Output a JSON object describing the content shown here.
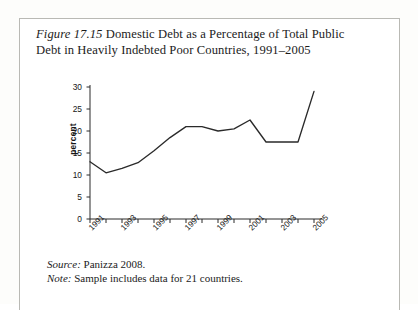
{
  "caption": {
    "figure_label": "Figure 17.15",
    "text": " Domestic Debt as a Percentage of Total Public Debt in Heavily Indebted Poor Countries, 1991–2005"
  },
  "notes": {
    "source_label": "Source:",
    "source_text": " Panizza 2008.",
    "note_label": "Note:",
    "note_text": " Sample includes data for 21 countries."
  },
  "chart_data": {
    "type": "line",
    "title": "Domestic Debt as a Percentage of Total Public Debt in Heavily Indebted Poor Countries, 1991–2005",
    "xlabel": "",
    "ylabel": "percent",
    "x": [
      1991,
      1992,
      1993,
      1994,
      1995,
      1996,
      1997,
      1998,
      1999,
      2000,
      2001,
      2002,
      2003,
      2004,
      2005
    ],
    "values": [
      13.0,
      10.5,
      11.5,
      12.8,
      15.5,
      18.5,
      21.0,
      21.0,
      20.0,
      20.5,
      22.5,
      17.5,
      17.5,
      17.5,
      29.0
    ],
    "ylim": [
      0,
      30
    ],
    "yticks": [
      0,
      5,
      10,
      15,
      20,
      25,
      30
    ],
    "xlim": [
      1991,
      2005
    ],
    "xtick_labels": [
      "1991",
      "1993",
      "1995",
      "1997",
      "1999",
      "2001",
      "2003",
      "2005"
    ],
    "xtick_years": [
      1991,
      1993,
      1995,
      1997,
      1999,
      2001,
      2003,
      2005
    ],
    "grid": false,
    "legend": "none",
    "line_color": "#2a2a2a"
  },
  "colors": {
    "line": "#2a2a2a",
    "axis": "#2a2a2a",
    "text": "#161616",
    "frame": "#b9b9b4",
    "page": "#fdfdfb"
  }
}
